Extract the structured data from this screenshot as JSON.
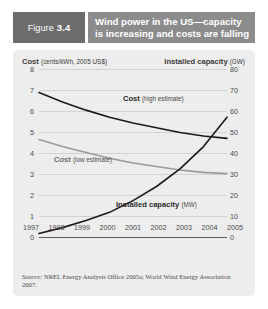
{
  "header": {
    "figure_word": "Figure",
    "figure_number": "3.4",
    "title_line1": "Wind power in the US—capacity",
    "title_line2": "is increasing and costs are falling"
  },
  "axis_titles": {
    "left_bold": "Cost",
    "left_unit": "(cents/kWh, 2005 US$)",
    "right_bold": "Installed capacity",
    "right_unit": "(GW)"
  },
  "series_labels": {
    "cost_high_bold": "Cost",
    "cost_high_paren": "(high estimate)",
    "cost_low_bold": "Cost",
    "cost_low_paren": "(low estimate)",
    "capacity_bold": "Installed capacity",
    "capacity_paren": "(MW)"
  },
  "source": {
    "label": "Source:",
    "text": " NREL Energy Analysis Office 2005a; World Wind Energy Association 2007."
  },
  "colors": {
    "figure_tag_bg": "#6d6d6d",
    "title_band_bg": "#8c8c8c",
    "panel_bg": "#ededed",
    "cost_high_line": "#1a1a1a",
    "cost_low_line": "#9a9a9a",
    "capacity_line": "#1a1a1a",
    "gridline": "#d2d2d2"
  },
  "chart_data": {
    "type": "line",
    "title": "Wind power in the US—capacity is increasing and costs are falling",
    "xlabel": "",
    "ylabel": "Cost (cents/kWh, 2005 US$)",
    "y2label": "Installed capacity (GW)",
    "grid": true,
    "legend": "in-plot labels",
    "x": [
      "1997",
      "1998",
      "1999",
      "2000",
      "2001",
      "2002",
      "2003",
      "2004",
      "2005"
    ],
    "ylim": [
      0,
      8
    ],
    "yticks": [
      "0",
      "1",
      "2",
      "3",
      "4",
      "5",
      "6",
      "7",
      "8"
    ],
    "y2lim": [
      0,
      80
    ],
    "y2ticks": [
      "0",
      "10",
      "20",
      "30",
      "40",
      "50",
      "60",
      "70",
      "80"
    ],
    "series": [
      {
        "name": "Cost (high estimate)",
        "axis": "left",
        "unit": "cents/kWh, 2005 US$",
        "color": "#1a1a1a",
        "values": [
          7.0,
          6.6,
          6.25,
          5.95,
          5.7,
          5.5,
          5.3,
          5.15,
          5.05
        ]
      },
      {
        "name": "Cost (low estimate)",
        "axis": "left",
        "unit": "cents/kWh, 2005 US$",
        "color": "#9a9a9a",
        "values": [
          5.0,
          4.7,
          4.45,
          4.2,
          4.0,
          3.85,
          3.7,
          3.6,
          3.55
        ]
      },
      {
        "name": "Installed capacity (MW)",
        "axis": "right",
        "unit": "GW",
        "color": "#1a1a1a",
        "values": [
          10.0,
          12.5,
          15.5,
          19.0,
          24.0,
          30.0,
          37.5,
          47.0,
          59.5
        ]
      }
    ]
  }
}
